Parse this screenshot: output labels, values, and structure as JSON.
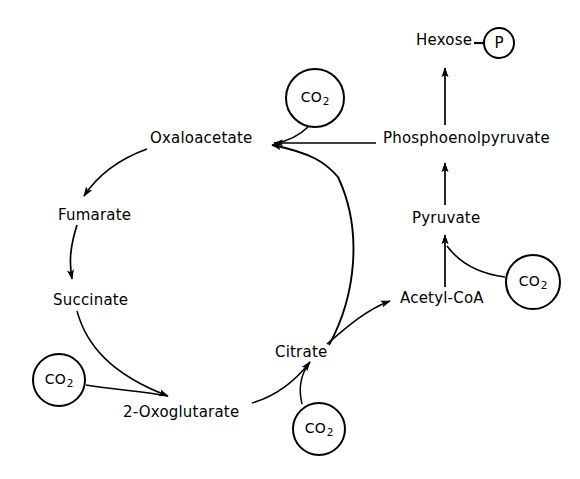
{
  "diagram": {
    "type": "biochemical-pathway",
    "background_color": "#ffffff",
    "stroke_color": "#000000"
  },
  "metabolites": [
    {
      "id": "oxaloacetate",
      "label": "Oxaloacetate",
      "x": 150,
      "y": 131
    },
    {
      "id": "fumarate",
      "label": "Fumarate",
      "x": 58,
      "y": 208
    },
    {
      "id": "succinate",
      "label": "Succinate",
      "x": 53,
      "y": 293
    },
    {
      "id": "oxoglutarate",
      "label": "2-Oxoglutarate",
      "x": 123,
      "y": 405
    },
    {
      "id": "citrate",
      "label": "Citrate",
      "x": 275,
      "y": 345
    },
    {
      "id": "acetyl-coa",
      "label": "Acetyl-CoA",
      "x": 400,
      "y": 291
    },
    {
      "id": "pyruvate",
      "label": "Pyruvate",
      "x": 412,
      "y": 211
    },
    {
      "id": "phosphoenolpyruvate",
      "label": "Phosphoenolpyruvate",
      "x": 383,
      "y": 131
    },
    {
      "id": "hexose",
      "label": "Hexose",
      "x": 416,
      "y": 33
    }
  ],
  "cofactors": [
    {
      "id": "co2-oxaloacetate",
      "label": "CO",
      "subscript": "2",
      "cx": 315,
      "cy": 98,
      "r": 30
    },
    {
      "id": "co2-pyruvate",
      "label": "CO",
      "subscript": "2",
      "cx": 533,
      "cy": 282,
      "r": 28
    },
    {
      "id": "co2-oxoglutarate",
      "label": "CO",
      "subscript": "2",
      "cx": 59,
      "cy": 380,
      "r": 27
    },
    {
      "id": "co2-citrate",
      "label": "CO",
      "subscript": "2",
      "cx": 319,
      "cy": 429,
      "r": 27
    }
  ],
  "phosphate_group": {
    "id": "phosphate",
    "label": "P",
    "cx": 499,
    "cy": 43,
    "r": 16
  },
  "reactions": [
    {
      "id": "oxaloacetate-to-fumarate",
      "from": "oxaloacetate",
      "to": "fumarate",
      "style": "curved"
    },
    {
      "id": "fumarate-to-succinate",
      "from": "fumarate",
      "to": "succinate",
      "style": "curved"
    },
    {
      "id": "succinate-to-oxoglutarate",
      "from": "succinate",
      "to": "2-Oxoglutarate",
      "style": "curved",
      "cofactor": "co2-oxoglutarate"
    },
    {
      "id": "oxoglutarate-to-citrate",
      "from": "2-Oxoglutarate",
      "to": "citrate",
      "style": "curved",
      "cofactor": "co2-citrate"
    },
    {
      "id": "citrate-to-oxaloacetate",
      "from": "citrate",
      "to": "oxaloacetate",
      "style": "curved"
    },
    {
      "id": "citrate-to-acetylcoa",
      "from": "citrate",
      "to": "acetyl-coa",
      "style": "curved"
    },
    {
      "id": "acetylcoa-to-pyruvate",
      "from": "acetyl-coa",
      "to": "pyruvate",
      "style": "straight",
      "cofactor": "co2-pyruvate"
    },
    {
      "id": "pyruvate-to-pep",
      "from": "pyruvate",
      "to": "phosphoenolpyruvate",
      "style": "straight"
    },
    {
      "id": "pep-to-oxaloacetate",
      "from": "phosphoenolpyruvate",
      "to": "oxaloacetate",
      "style": "straight",
      "cofactor": "co2-oxaloacetate"
    },
    {
      "id": "pep-to-hexose",
      "from": "phosphoenolpyruvate",
      "to": "hexose",
      "style": "straight"
    }
  ]
}
